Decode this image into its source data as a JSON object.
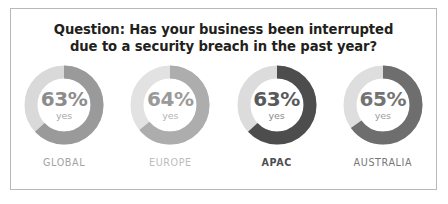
{
  "card": {
    "border_color": "#b8b8b8",
    "background": "#ffffff"
  },
  "header": {
    "title_line1": "Question: Has your business been interrupted",
    "title_line2": "due to a security breach in the past year?",
    "title_color": "#231f20"
  },
  "chart_data": {
    "type": "pie",
    "title": "Question: Has your business been interrupted due to a security breach in the past year?",
    "subtitle": "",
    "xlabel": "",
    "ylabel": "",
    "legend_position": "none",
    "grid": false,
    "unit": "%",
    "answer_label": "yes",
    "categories": [
      "GLOBAL",
      "EUROPE",
      "APAC",
      "AUSTRALIA"
    ],
    "values": [
      63,
      64,
      63,
      65
    ],
    "series": [
      {
        "name": "yes",
        "values": [
          63,
          64,
          63,
          65
        ]
      }
    ],
    "donuts": [
      {
        "label": "GLOBAL",
        "value": 63,
        "value_text": "63%",
        "answer": "yes",
        "arc_color": "#9a9a9a",
        "track_color": "#d9d9d9",
        "value_color": "#8c8c8c",
        "answer_color": "#a8a8a8",
        "label_color": "#a3a3a3",
        "label_bold": false
      },
      {
        "label": "EUROPE",
        "value": 64,
        "value_text": "64%",
        "answer": "yes",
        "arc_color": "#adadad",
        "track_color": "#e2e2e2",
        "value_color": "#9a9a9a",
        "answer_color": "#b3b3b3",
        "label_color": "#bdbdbd",
        "label_bold": false
      },
      {
        "label": "APAC",
        "value": 63,
        "value_text": "63%",
        "answer": "yes",
        "arc_color": "#4d4d4d",
        "track_color": "#dcdcdc",
        "value_color": "#595959",
        "answer_color": "#8a8a8a",
        "label_color": "#4f4f4f",
        "label_bold": true
      },
      {
        "label": "AUSTRALIA",
        "value": 65,
        "value_text": "65%",
        "answer": "yes",
        "arc_color": "#6e6e6e",
        "track_color": "#dedede",
        "value_color": "#737373",
        "answer_color": "#9c9c9c",
        "label_color": "#787878",
        "label_bold": false
      }
    ]
  }
}
